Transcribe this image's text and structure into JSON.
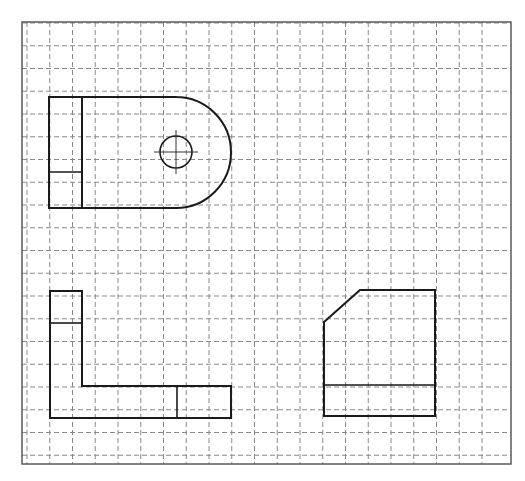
{
  "drawing": {
    "type": "orthographic-projection-on-grid",
    "colors": {
      "background": "#ffffff",
      "grid": "#8a8a8a",
      "border": "#5a5a5a",
      "outline": "#1a1a1a"
    },
    "frame": {
      "x": 22,
      "y": 22,
      "width": 489,
      "height": 442
    },
    "grid": {
      "style": "dashed",
      "spacing": 22.75,
      "vertical_start_x": 27,
      "vertical_count": 21,
      "horizontal_start_y": 23,
      "horizontal_count": 20
    },
    "views": [
      {
        "name": "top-view",
        "outline": "rectangle with semicircular right end",
        "left": 49,
        "top": 97,
        "bottom": 208,
        "arc_start_x": 176,
        "arc_right_x": 231,
        "inner_vertical_x": 82,
        "divider_y": 172,
        "hole": {
          "cx": 176,
          "cy": 152,
          "r": 16,
          "center_mark": true
        }
      },
      {
        "name": "front-view",
        "outline": "L-shape",
        "points": [
          [
            50,
            291
          ],
          [
            82,
            291
          ],
          [
            82,
            386
          ],
          [
            231,
            386
          ],
          [
            231,
            418
          ],
          [
            50,
            418
          ]
        ],
        "crossbar_y": 323,
        "divider_x": 177
      },
      {
        "name": "side-view",
        "outline": "rectangle with chamfered top-left corner",
        "points": [
          [
            324,
            322
          ],
          [
            360,
            290
          ],
          [
            435,
            290
          ],
          [
            435,
            416
          ],
          [
            324,
            416
          ]
        ],
        "divider_y": 385
      }
    ]
  }
}
